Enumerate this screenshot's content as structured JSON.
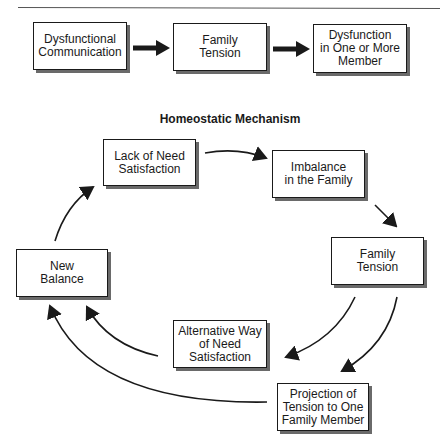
{
  "top_row": {
    "boxes": [
      {
        "label": "Dysfunctional\nCommunication"
      },
      {
        "label": "Family\nTension"
      },
      {
        "label": "Dysfunction\nin One or More\nMember"
      }
    ]
  },
  "cycle": {
    "title": "Homeostatic Mechanism",
    "boxes": [
      {
        "id": "lack",
        "label": "Lack of Need\nSatisfaction"
      },
      {
        "id": "imbalance",
        "label": "Imbalance\nin the Family"
      },
      {
        "id": "tension",
        "label": "Family\nTension"
      },
      {
        "id": "projection",
        "label": "Projection of\nTension to One\nFamily Member"
      },
      {
        "id": "alternative",
        "label": "Alternative Way\nof Need\nSatisfaction"
      },
      {
        "id": "balance",
        "label": "New\nBalance"
      }
    ]
  },
  "colors": {
    "stroke": "#1a1a1a",
    "shadow": "#6a6a6a",
    "background": "#ffffff"
  }
}
